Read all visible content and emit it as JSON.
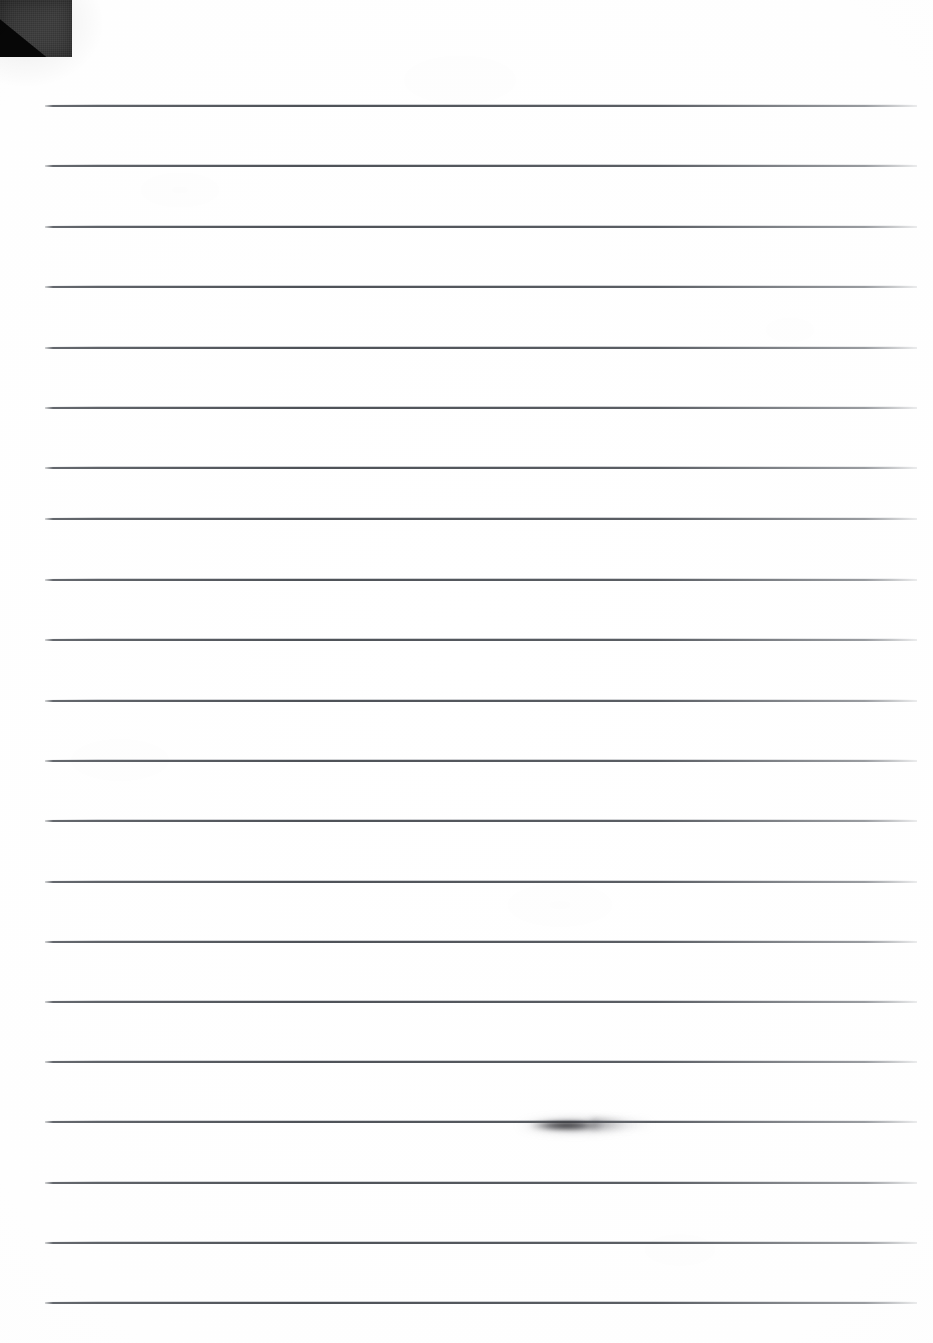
{
  "document": {
    "type": "scanned-lined-paper",
    "title": "Blank ruled notebook page",
    "description": "Scan of a blank sheet of wide-ruled lined paper with no handwriting or printed text",
    "width_px": 933,
    "height_px": 1343,
    "background_color": "#fefefe",
    "page_color": "#ffffff"
  },
  "ruling": {
    "line_count": 21,
    "line_color": "#4a4e54",
    "line_thickness_px": 2,
    "line_spacing_px": 60.3,
    "first_line_y": 105,
    "left_margin_x": 45,
    "right_margin_x": 917,
    "line_length_px": 872,
    "lines_y": [
      105,
      165,
      226,
      286,
      347,
      407,
      467,
      518,
      579,
      639,
      700,
      760,
      820,
      881,
      941,
      1001,
      1061,
      1121,
      1182,
      1242,
      1302
    ],
    "has_vertical_margin_rule": false,
    "has_holes": false
  },
  "artifacts": [
    {
      "name": "corner-shadow-artifact",
      "kind": "scan-shadow",
      "position": "top-left",
      "x": 0,
      "y": 0,
      "width": 72,
      "height": 57,
      "color": "#3b3b3b",
      "accent_color": "#070707"
    },
    {
      "name": "ink-smudge-artifact",
      "kind": "ink-smudge",
      "position": "lower-middle",
      "x": 505,
      "y": 1111,
      "width": 148,
      "height": 26,
      "on_line_index": 17,
      "color": "#1a1a1c"
    }
  ],
  "content": {
    "text": "",
    "has_writing": false,
    "has_printed_text": false,
    "note": "No legible text, handwriting, headings, or markings appear on the page."
  }
}
